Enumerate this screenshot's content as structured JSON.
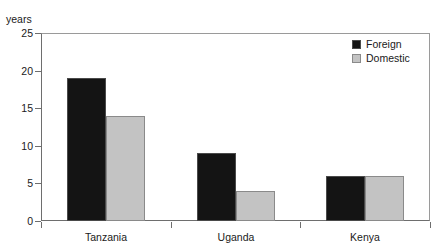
{
  "chart_data": {
    "type": "bar",
    "title": "",
    "xlabel": "",
    "ylabel": "years",
    "ylim": [
      0,
      25
    ],
    "yticks": [
      0,
      5,
      10,
      15,
      20,
      25
    ],
    "ytick_labels": [
      "0",
      "5",
      "10",
      "15",
      "20",
      "25"
    ],
    "grid": false,
    "legend_position": "top-right",
    "categories": [
      "Tanzania",
      "Uganda",
      "Kenya"
    ],
    "series": [
      {
        "name": "Foreign",
        "color": "#141414",
        "values": [
          19,
          9,
          6
        ]
      },
      {
        "name": "Domestic",
        "color": "#c3c3c3",
        "values": [
          14,
          4,
          6
        ]
      }
    ]
  },
  "axis": {
    "unit_label": "years"
  },
  "legend": {
    "entries": [
      {
        "label": "Foreign",
        "swatch": "foreign-swatch"
      },
      {
        "label": "Domestic",
        "swatch": "domestic-swatch"
      }
    ]
  },
  "title_remnant": {
    "text": ""
  }
}
